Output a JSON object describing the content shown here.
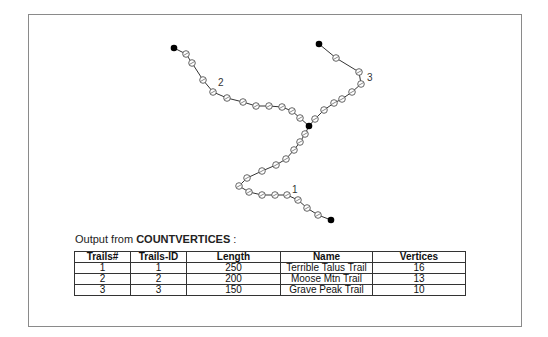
{
  "diagram": {
    "trails": [
      {
        "label": "1",
        "label_pos": [
          292,
          193
        ],
        "points": [
          [
            309,
            126
          ],
          [
            305,
            134
          ],
          [
            300,
            142
          ],
          [
            294,
            150
          ],
          [
            286,
            159
          ],
          [
            276,
            165
          ],
          [
            262,
            171
          ],
          [
            247,
            178
          ],
          [
            239,
            186
          ],
          [
            249,
            192
          ],
          [
            262,
            195
          ],
          [
            275,
            195
          ],
          [
            287,
            195
          ],
          [
            298,
            200
          ],
          [
            307,
            208
          ],
          [
            318,
            215
          ],
          [
            331,
            220
          ]
        ]
      },
      {
        "label": "2",
        "label_pos": [
          218,
          86
        ],
        "points": [
          [
            174,
            48
          ],
          [
            186,
            54
          ],
          [
            192,
            63
          ],
          [
            203,
            80
          ],
          [
            213,
            92
          ],
          [
            227,
            98
          ],
          [
            243,
            102
          ],
          [
            256,
            106
          ],
          [
            269,
            106
          ],
          [
            282,
            107
          ],
          [
            292,
            111
          ],
          [
            300,
            118
          ],
          [
            309,
            126
          ]
        ]
      },
      {
        "label": "3",
        "label_pos": [
          367,
          81
        ],
        "points": [
          [
            319,
            44
          ],
          [
            336,
            58
          ],
          [
            359,
            72
          ],
          [
            361,
            84
          ],
          [
            352,
            92
          ],
          [
            342,
            99
          ],
          [
            334,
            103
          ],
          [
            324,
            110
          ],
          [
            315,
            119
          ],
          [
            309,
            126
          ]
        ]
      }
    ],
    "endpoints": [
      [
        174,
        48
      ],
      [
        319,
        44
      ],
      [
        309,
        126
      ],
      [
        331,
        220
      ]
    ]
  },
  "caption": {
    "prefix": "Output from ",
    "command": "COUNTVERTICES",
    "suffix": " :"
  },
  "table": {
    "headers": [
      "Trails#",
      "Trails-ID",
      "Length",
      "Name",
      "Vertices"
    ],
    "rows": [
      [
        "1",
        "1",
        "250",
        "Terrible Talus Trail",
        "16"
      ],
      [
        "2",
        "2",
        "200",
        "Moose Mtn Trail",
        "13"
      ],
      [
        "3",
        "3",
        "150",
        "Grave Peak Trail",
        "10"
      ]
    ]
  }
}
